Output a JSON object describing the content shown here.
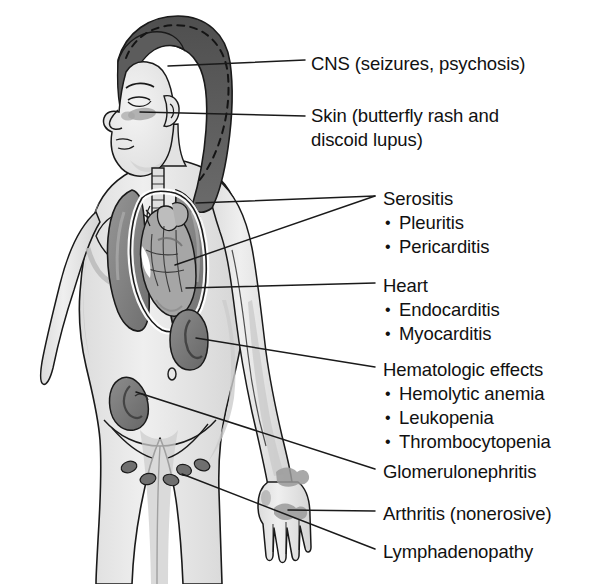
{
  "figure": {
    "background_color": "#ffffff",
    "line_color": "#1a1a1a",
    "palette": {
      "skin_light": "#e9e9e9",
      "skin_shadow": "#cfcfcf",
      "hair_dark": "#595959",
      "lung": "#8a8a8a",
      "heart": "#a8a8a8",
      "kidney": "#7e7e7e",
      "lymph_node": "#6f6f6f",
      "outline": "#1a1a1a"
    }
  },
  "labels": [
    {
      "id": "cns",
      "name": "CNS (seizures, psychosis)",
      "bullets": [],
      "x": 311,
      "y": 52
    },
    {
      "id": "skin",
      "name": "Skin (butterfly rash and discoid lupus)",
      "bullets": [],
      "x": 311,
      "y": 104
    },
    {
      "id": "serositis",
      "name": "Serositis",
      "bullets": [
        "Pleuritis",
        "Pericarditis"
      ],
      "x": 383,
      "y": 187
    },
    {
      "id": "heart",
      "name": "Heart",
      "bullets": [
        "Endocarditis",
        "Myocarditis"
      ],
      "x": 383,
      "y": 274
    },
    {
      "id": "hematologic",
      "name": "Hematologic effects",
      "bullets": [
        "Hemolytic anemia",
        "Leukopenia",
        "Thrombocytopenia"
      ],
      "x": 383,
      "y": 358
    },
    {
      "id": "glomerulonephritis",
      "name": "Glomerulonephritis",
      "bullets": [],
      "x": 383,
      "y": 460
    },
    {
      "id": "arthritis",
      "name": "Arthritis (nonerosive)",
      "bullets": [],
      "x": 383,
      "y": 502
    },
    {
      "id": "lymphadenopathy",
      "name": "Lymphadenopathy",
      "bullets": [],
      "x": 383,
      "y": 540
    }
  ],
  "anatomy": [
    {
      "id": "head-hair",
      "label": "hair"
    },
    {
      "id": "face",
      "label": "face-profile"
    },
    {
      "id": "butterfly-rash",
      "label": "malar-butterfly-rash"
    },
    {
      "id": "trachea",
      "label": "trachea"
    },
    {
      "id": "lung-left",
      "label": "left-lung"
    },
    {
      "id": "lung-right",
      "label": "right-lung"
    },
    {
      "id": "pericardium",
      "label": "pericardial-sac"
    },
    {
      "id": "heart-organ",
      "label": "heart"
    },
    {
      "id": "kidney-upper",
      "label": "right-kidney"
    },
    {
      "id": "kidney-lower",
      "label": "left-kidney"
    },
    {
      "id": "lymph-nodes",
      "label": "inguinal-lymph-nodes"
    },
    {
      "id": "hand-joints",
      "label": "hand-joint-inflammation"
    }
  ]
}
